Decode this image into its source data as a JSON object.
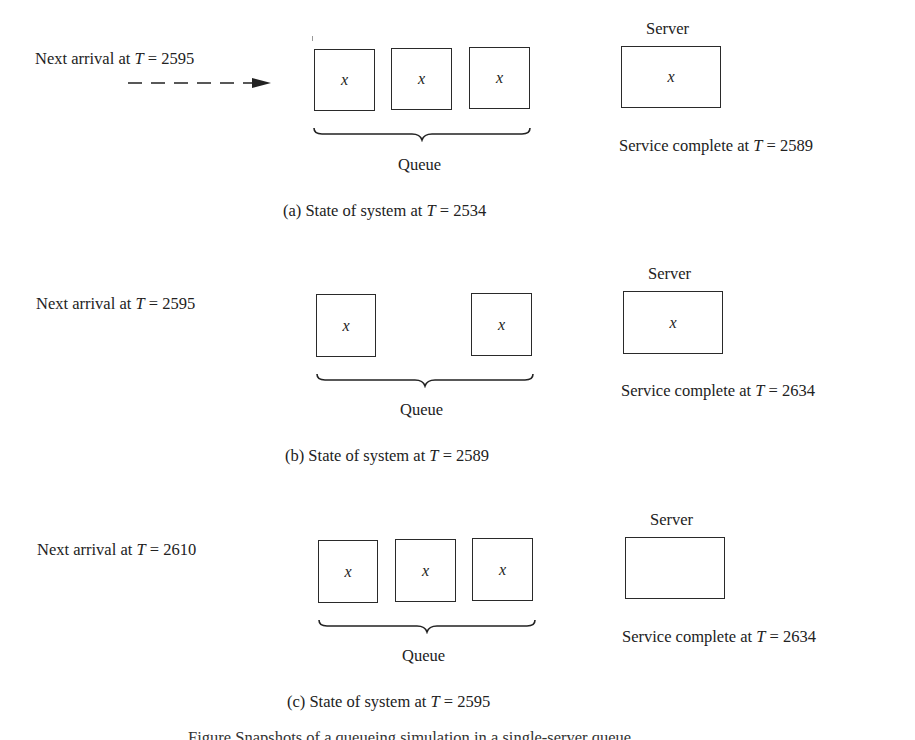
{
  "panels": [
    {
      "id": "a",
      "next_arrival": {
        "prefix": "Next arrival at ",
        "var": "T",
        "eq": " = 2595"
      },
      "show_arrival_arrow": true,
      "queue_label": "Queue",
      "queue_slots": [
        "x",
        "x",
        "x"
      ],
      "server_label": "Server",
      "server_content": "x",
      "service_complete": {
        "prefix": "Service complete at ",
        "var": "T",
        "eq": " = 2589"
      },
      "caption": {
        "prefix": "(a) State of system at ",
        "var": "T",
        "eq": " = 2534"
      }
    },
    {
      "id": "b",
      "next_arrival": {
        "prefix": "Next arrival at ",
        "var": "T",
        "eq": " = 2595"
      },
      "show_arrival_arrow": false,
      "queue_label": "Queue",
      "queue_slots": [
        "x",
        "",
        "x"
      ],
      "server_label": "Server",
      "server_content": "x",
      "service_complete": {
        "prefix": "Service complete at ",
        "var": "T",
        "eq": " = 2634"
      },
      "caption": {
        "prefix": "(b) State of system at ",
        "var": "T",
        "eq": " = 2589"
      }
    },
    {
      "id": "c",
      "next_arrival": {
        "prefix": "Next arrival at ",
        "var": "T",
        "eq": " = 2610"
      },
      "show_arrival_arrow": false,
      "queue_label": "Queue",
      "queue_slots": [
        "x",
        "x",
        "x"
      ],
      "server_label": "Server",
      "server_content": "",
      "service_complete": {
        "prefix": "Service complete at ",
        "var": "T",
        "eq": " = 2634"
      },
      "caption": {
        "prefix": "(c) State of system at ",
        "var": "T",
        "eq": " = 2595"
      }
    }
  ],
  "figure_caption_clipped": "Figure  Snapshots of a queueing simulation in a single-server queue"
}
